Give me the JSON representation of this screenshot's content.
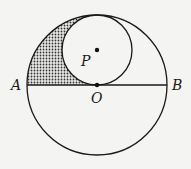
{
  "diagram": {
    "type": "geometry",
    "big_circle": {
      "center_label": "O",
      "cx": 97,
      "cy": 85,
      "r": 70
    },
    "small_circle": {
      "center_label": "P",
      "cx": 97,
      "cy": 50,
      "r": 35
    },
    "diameter": {
      "from": "A",
      "to": "B"
    },
    "points": [
      {
        "label": "A",
        "x": 27,
        "y": 85
      },
      {
        "label": "B",
        "x": 167,
        "y": 85
      },
      {
        "label": "O",
        "x": 97,
        "y": 85
      },
      {
        "label": "P",
        "x": 97,
        "y": 50
      }
    ],
    "labels": {
      "A": "A",
      "B": "B",
      "O": "O",
      "P": "P"
    },
    "shaded_region": "upper-left region inside big circle, outside small circle, above AB",
    "colors": {
      "line": "#1a1a1a",
      "shade_dot": "#333333",
      "background": "#f4f4f2"
    }
  }
}
